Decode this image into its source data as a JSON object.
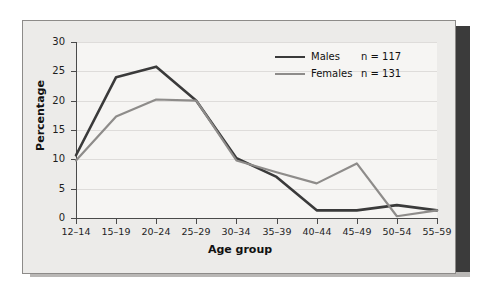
{
  "figure": {
    "panel_background": "#ecebe9",
    "plot_background": "#f6f5f3",
    "border_color": "#8d8b89",
    "shadow_color": "#3b3b3b"
  },
  "chart_data": {
    "type": "line",
    "title": "",
    "xlabel": "Age group",
    "ylabel": "Percentage",
    "categories": [
      "12–14",
      "15–19",
      "20–24",
      "25–29",
      "30–34",
      "35–39",
      "40–44",
      "45–49",
      "50–54",
      "55–59"
    ],
    "yticks": [
      0,
      5,
      10,
      15,
      20,
      25,
      30
    ],
    "ylim": [
      0,
      30
    ],
    "grid": true,
    "legend_position": "top-right",
    "series": [
      {
        "name": "Males",
        "n_label": "n = 117",
        "n": 117,
        "color": "#3a3a3a",
        "width": 2.6,
        "values": [
          10.7,
          24.0,
          25.8,
          20.0,
          10.2,
          7.0,
          1.3,
          1.3,
          2.2,
          1.3
        ]
      },
      {
        "name": "Females",
        "n_label": "n = 131",
        "n": 131,
        "color": "#8e8c8a",
        "width": 2.2,
        "values": [
          9.8,
          17.3,
          20.2,
          20.0,
          9.8,
          7.8,
          5.9,
          9.3,
          0.3,
          1.3
        ]
      }
    ]
  }
}
